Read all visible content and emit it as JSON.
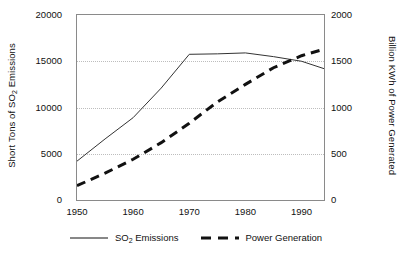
{
  "chart_data": {
    "type": "line",
    "title": "",
    "xlabel": "",
    "xlim": [
      1950,
      1994
    ],
    "xticks": [
      1950,
      1960,
      1970,
      1980,
      1990
    ],
    "xtick_labels": [
      "1950",
      "1960",
      "1970",
      "1980",
      "1990"
    ],
    "grid": true,
    "grid_axis": "y",
    "legend_position": "bottom",
    "axes": {
      "left": {
        "label_parts": {
          "pre": "Short Tons of SO",
          "sub": "2",
          "post": " Emissions"
        },
        "label_plain": "Short Tons of SO2 Emissions",
        "ylim": [
          0,
          20000
        ],
        "yticks": [
          0,
          5000,
          10000,
          15000,
          20000
        ],
        "ytick_labels": [
          "0",
          "5000",
          "10000",
          "15000",
          "20000"
        ]
      },
      "right": {
        "label_plain": "Billion KWh of Power Generated",
        "ylim": [
          0,
          2000
        ],
        "yticks": [
          0,
          500,
          1000,
          1500,
          2000
        ],
        "ytick_labels": [
          "0",
          "500",
          "1000",
          "1500",
          "2000"
        ]
      }
    },
    "series": [
      {
        "name_parts": {
          "pre": "SO",
          "sub": "2",
          "post": " Emissions"
        },
        "name": "SO2 Emissions",
        "axis": "left",
        "style": "solid",
        "color": "#333333",
        "width": 1,
        "x": [
          1950,
          1955,
          1960,
          1965,
          1970,
          1975,
          1980,
          1985,
          1990,
          1994
        ],
        "values": [
          4200,
          6600,
          8900,
          12100,
          15750,
          15800,
          15900,
          15500,
          15000,
          14200
        ]
      },
      {
        "name": "Power Generation",
        "axis": "right",
        "style": "dashed",
        "color": "#111111",
        "width": 3,
        "x": [
          1950,
          1955,
          1960,
          1965,
          1970,
          1975,
          1980,
          1985,
          1990,
          1994
        ],
        "values": [
          155,
          290,
          440,
          620,
          830,
          1060,
          1250,
          1430,
          1560,
          1630
        ]
      }
    ]
  },
  "legend": {
    "items": [
      {
        "label_plain": "SO2 Emissions",
        "pre": "SO",
        "sub": "2",
        "post": " Emissions",
        "style": "solid"
      },
      {
        "label_plain": "Power Generation",
        "pre": "Power Generation",
        "sub": "",
        "post": "",
        "style": "dashed"
      }
    ]
  }
}
